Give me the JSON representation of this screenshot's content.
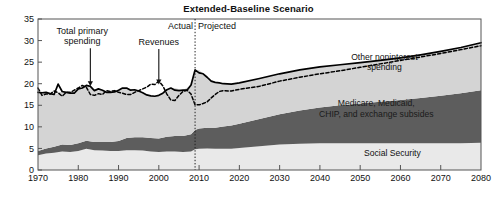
{
  "chart_title": "Extended-Baseline Scenario",
  "chart_data": {
    "type": "area",
    "title": "Extended-Baseline Scenario",
    "xlabel": "",
    "ylabel": "",
    "xlim": [
      1970,
      2080
    ],
    "ylim": [
      0,
      35
    ],
    "grid": false,
    "legend_position": "inline-annotations",
    "x_ticks": [
      "1970",
      "1980",
      "1990",
      "2000",
      "2010",
      "2020",
      "2030",
      "2040",
      "2050",
      "2060",
      "2070",
      "2080"
    ],
    "y_ticks": [
      "0",
      "5",
      "10",
      "15",
      "20",
      "25",
      "30",
      "35"
    ],
    "divider": {
      "x": 2009,
      "left_label": "Actual",
      "right_label": "Projected",
      "style": "dotted"
    },
    "annotations": [
      {
        "label": "Total primary spending",
        "points_to_x": 1983,
        "points_to_y": 19.4,
        "text_x": 1981,
        "text_y": 31.6
      },
      {
        "label": "Revenues",
        "points_to_x": 2000,
        "points_to_y": 19.8,
        "text_x": 2000,
        "text_y": 29.0
      }
    ],
    "band_labels": [
      {
        "label": "Other noninterest spending",
        "x": 2056,
        "y": 25.5
      },
      {
        "label": "Medicare, Medicaid, CHIP, and exchange subsides",
        "x": 2054,
        "y": 14.8
      },
      {
        "label": "Social Security",
        "x": 2058,
        "y": 3.2
      }
    ],
    "colors": {
      "social_security": "#e9e9e9",
      "health_programs": "#5d5d5d",
      "other_noninterest": "#d4d4d4",
      "total_primary_spending_line": "#000000",
      "revenues_line": "#000000",
      "frame": "#555555"
    },
    "x": [
      1970,
      1972,
      1974,
      1976,
      1978,
      1980,
      1982,
      1984,
      1986,
      1988,
      1990,
      1992,
      1994,
      1996,
      1998,
      2000,
      2002,
      2004,
      2006,
      2008,
      2009,
      2010,
      2012,
      2014,
      2016,
      2018,
      2020,
      2025,
      2030,
      2035,
      2040,
      2045,
      2050,
      2055,
      2060,
      2065,
      2070,
      2075,
      2080
    ],
    "series": [
      {
        "name": "Social Security",
        "values": [
          3.4,
          3.8,
          4.0,
          4.3,
          4.2,
          4.4,
          4.9,
          4.6,
          4.5,
          4.4,
          4.4,
          4.6,
          4.6,
          4.5,
          4.3,
          4.2,
          4.3,
          4.3,
          4.2,
          4.3,
          4.8,
          4.9,
          5.0,
          4.9,
          4.9,
          4.9,
          5.1,
          5.5,
          5.9,
          6.1,
          6.2,
          6.2,
          6.2,
          6.2,
          6.2,
          6.2,
          6.2,
          6.2,
          6.3
        ]
      },
      {
        "name": "Medicare, Medicaid, CHIP, and exchange subsides",
        "values": [
          1.0,
          1.2,
          1.4,
          1.6,
          1.6,
          1.8,
          1.9,
          1.9,
          2.0,
          2.1,
          2.3,
          2.8,
          3.0,
          3.1,
          3.1,
          3.1,
          3.4,
          3.6,
          3.7,
          4.0,
          4.5,
          4.7,
          4.8,
          4.9,
          5.2,
          5.4,
          5.6,
          6.3,
          7.0,
          7.7,
          8.3,
          8.8,
          9.2,
          9.6,
          10.0,
          10.5,
          11.0,
          11.6,
          12.2
        ]
      },
      {
        "name": "Other noninterest spending",
        "values": [
          13.6,
          13.0,
          12.1,
          12.3,
          12.0,
          12.6,
          12.8,
          11.9,
          12.0,
          11.5,
          11.8,
          11.6,
          11.0,
          10.3,
          9.8,
          10.0,
          10.9,
          11.1,
          10.6,
          11.4,
          13.9,
          13.6,
          11.7,
          10.5,
          9.8,
          9.6,
          9.5,
          9.4,
          9.4,
          9.4,
          9.4,
          9.4,
          9.5,
          9.6,
          9.8,
          10.0,
          10.3,
          10.6,
          11.0
        ]
      }
    ],
    "lines": [
      {
        "name": "Total primary spending",
        "style": "solid",
        "x": [
          1970,
          1971,
          1972,
          1973,
          1974,
          1975,
          1976,
          1977,
          1978,
          1979,
          1980,
          1981,
          1982,
          1983,
          1984,
          1985,
          1986,
          1987,
          1988,
          1989,
          1990,
          1991,
          1992,
          1993,
          1994,
          1995,
          1996,
          1997,
          1998,
          1999,
          2000,
          2001,
          2002,
          2003,
          2004,
          2005,
          2006,
          2007,
          2008,
          2009,
          2010,
          2011,
          2012,
          2013,
          2014,
          2015,
          2016,
          2018,
          2020,
          2025,
          2030,
          2035,
          2040,
          2045,
          2050,
          2055,
          2060,
          2065,
          2070,
          2075,
          2080
        ],
        "y": [
          18.0,
          17.9,
          18.0,
          17.7,
          17.5,
          19.9,
          18.2,
          18.0,
          17.8,
          17.8,
          18.8,
          19.0,
          19.6,
          19.4,
          18.4,
          18.8,
          18.5,
          18.0,
          18.0,
          18.1,
          18.5,
          19.0,
          19.0,
          18.5,
          18.6,
          18.3,
          17.9,
          17.4,
          17.2,
          17.1,
          17.3,
          17.8,
          18.6,
          19.0,
          18.5,
          18.4,
          18.5,
          18.5,
          19.7,
          23.2,
          22.5,
          22.3,
          21.5,
          20.6,
          20.3,
          20.2,
          20.0,
          19.9,
          20.2,
          21.2,
          22.3,
          23.2,
          23.9,
          24.4,
          24.9,
          25.4,
          26.0,
          26.7,
          27.5,
          28.4,
          29.5
        ]
      },
      {
        "name": "Revenues",
        "style": "dashed",
        "x": [
          1970,
          1971,
          1972,
          1973,
          1974,
          1975,
          1976,
          1977,
          1978,
          1979,
          1980,
          1981,
          1982,
          1983,
          1984,
          1985,
          1986,
          1987,
          1988,
          1989,
          1990,
          1991,
          1992,
          1993,
          1994,
          1995,
          1996,
          1997,
          1998,
          1999,
          2000,
          2001,
          2002,
          2003,
          2004,
          2005,
          2006,
          2007,
          2008,
          2009,
          2010,
          2011,
          2012,
          2013,
          2014,
          2015,
          2016,
          2018,
          2020,
          2025,
          2030,
          2035,
          2040,
          2045,
          2050,
          2055,
          2060,
          2065,
          2070,
          2075,
          2080
        ],
        "y": [
          19.0,
          17.3,
          17.6,
          17.6,
          18.3,
          17.9,
          17.1,
          18.0,
          18.0,
          18.5,
          19.0,
          19.6,
          19.2,
          17.5,
          17.3,
          17.7,
          17.5,
          18.4,
          18.2,
          18.4,
          18.0,
          17.8,
          17.5,
          17.5,
          18.0,
          18.4,
          18.8,
          19.2,
          19.9,
          19.8,
          20.6,
          19.5,
          17.6,
          16.2,
          16.1,
          17.3,
          18.2,
          18.5,
          17.6,
          15.1,
          15.1,
          15.4,
          15.8,
          16.7,
          17.5,
          18.2,
          18.4,
          18.3,
          18.7,
          19.4,
          20.6,
          21.5,
          22.3,
          23.0,
          23.8,
          24.6,
          25.4,
          26.2,
          27.0,
          27.9,
          28.8
        ]
      }
    ]
  }
}
